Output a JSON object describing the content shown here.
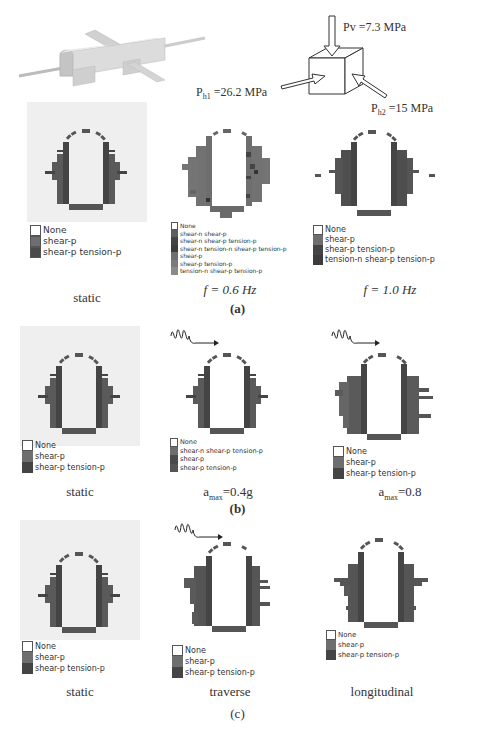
{
  "figure": {
    "model_3d": {
      "description": "3D tunnel model with cross passages"
    },
    "stress_labels": {
      "pv": {
        "symbol": "Pv",
        "value": "=7.3 MPa"
      },
      "ph1": {
        "symbol": "P",
        "subscript": "h1",
        "value": "=26.2 MPa"
      },
      "ph2": {
        "symbol": "P",
        "subscript": "h2",
        "value": "=15 MPa"
      }
    },
    "colors": {
      "none": "#ffffff",
      "shear_p": "#6e6e6e",
      "shear_p_tension_p": "#4a4a4a",
      "shear_n_shear_p": "#5e5e5e",
      "tension_n": "#3c3c3c",
      "light": "#8a8a8a",
      "panel_bg": "#efefef"
    },
    "rows": [
      {
        "id": "a",
        "label": "(a)",
        "panels": [
          {
            "caption": "static",
            "legend": [
              "None",
              "shear-p",
              "shear-p tension-p"
            ]
          },
          {
            "caption": "f = 0.6 Hz",
            "legend": [
              "None",
              "shear-n shear-p",
              "shear-n shear-p tension-p",
              "shear-n tension-n shear-p tension-p",
              "shear-p",
              "shear-p tension-p",
              "tension-n shear-p tension-p"
            ]
          },
          {
            "caption": "f = 1.0 Hz",
            "legend": [
              "None",
              "shear-p",
              "shear-p tension-p",
              "tension-n shear-p tension-p"
            ]
          }
        ]
      },
      {
        "id": "b",
        "label": "(b)",
        "panels": [
          {
            "caption": "static",
            "legend": [
              "None",
              "shear-p",
              "shear-p tension-p"
            ]
          },
          {
            "caption_main": "a",
            "caption_sub": "max",
            "caption_value": "=0.4g",
            "legend": [
              "None",
              "shear-n shear-p tension-p",
              "shear-p",
              "shear-p tension-p"
            ]
          },
          {
            "caption_main": "a",
            "caption_sub": "max",
            "caption_value": "=0.8",
            "legend": [
              "None",
              "shear-p",
              "shear-p tension-p"
            ]
          }
        ]
      },
      {
        "id": "c",
        "label": "(c)",
        "panels": [
          {
            "caption": "static",
            "legend": [
              "None",
              "shear-p",
              "shear-p tension-p"
            ]
          },
          {
            "caption": "traverse",
            "legend": [
              "None",
              "shear-p",
              "shear-p tension-p"
            ]
          },
          {
            "caption": "longitudinal",
            "legend": [
              "None",
              "shear-p",
              "shear-p tension-p"
            ]
          }
        ]
      }
    ]
  }
}
